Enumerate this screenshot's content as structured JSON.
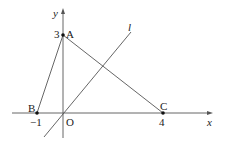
{
  "diagram": {
    "type": "coordinate-geometry",
    "axes": {
      "x_label": "x",
      "y_label": "y",
      "origin_label": "O"
    },
    "points": [
      {
        "name": "A",
        "coords": [
          0,
          3
        ],
        "tick_label": "3"
      },
      {
        "name": "B",
        "coords": [
          -1,
          0
        ],
        "tick_label": "-1"
      },
      {
        "name": "C",
        "coords": [
          4,
          0
        ],
        "tick_label": "4"
      }
    ],
    "segments": [
      "AB",
      "AC"
    ],
    "line": {
      "name": "l",
      "passes_through": "O"
    },
    "colors": {
      "stroke": "#555555",
      "text": "#222222",
      "point": "#111111"
    }
  },
  "labels": {
    "x": "x",
    "y": "y",
    "O": "O",
    "A": "A",
    "B": "B",
    "C": "C",
    "l": "l",
    "t3": "3",
    "tm1": "−1",
    "t4": "4"
  }
}
